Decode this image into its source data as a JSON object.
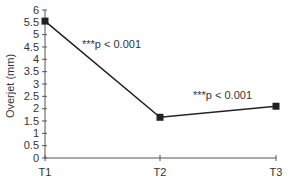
{
  "chart_data": {
    "type": "line",
    "title": "",
    "xlabel": "",
    "ylabel": "Overjet (mm)",
    "categories": [
      "T1",
      "T2",
      "T3"
    ],
    "series": [
      {
        "name": "Overjet",
        "values": [
          5.55,
          1.65,
          2.1
        ],
        "marker": "square",
        "color": "#222222"
      }
    ],
    "ylim": [
      0,
      6
    ],
    "yticks": [
      "0",
      "0.5",
      "1",
      "1.5",
      "2",
      "2.5",
      "3",
      "3.5",
      "4",
      "4.5",
      "5",
      "5.5",
      "6"
    ],
    "grid": false,
    "legend": null,
    "annotations": [
      {
        "text": "***p < 0.001",
        "between": [
          "T1",
          "T2"
        ]
      },
      {
        "text": "***p < 0.001",
        "between": [
          "T2",
          "T3"
        ]
      }
    ]
  }
}
